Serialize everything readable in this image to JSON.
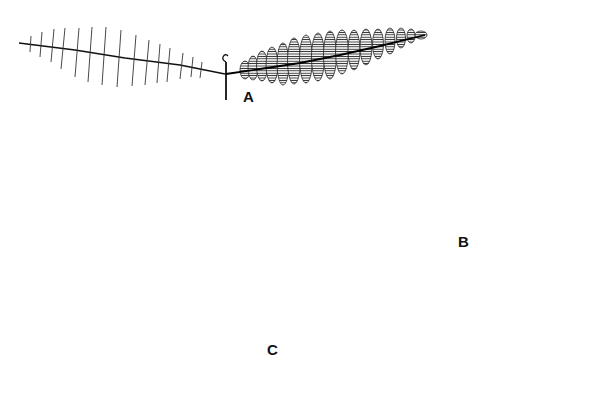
{
  "figure": {
    "background": "#ffffff",
    "ink": "#111111",
    "panels": [
      {
        "id": "A",
        "label": "A",
        "subject": "single pinna: left half with leaflets folded (closed), right half with leaflets open"
      },
      {
        "id": "B",
        "label": "B",
        "subject": "bipinnate leaf with pinnae pairs along zigzag rachis, leaflets folded"
      },
      {
        "id": "C",
        "label": "C",
        "subject": "shoot with open compound leaves (fern-like pinnae)"
      }
    ]
  },
  "labels": {
    "a": "A",
    "b": "B",
    "c": "C"
  }
}
